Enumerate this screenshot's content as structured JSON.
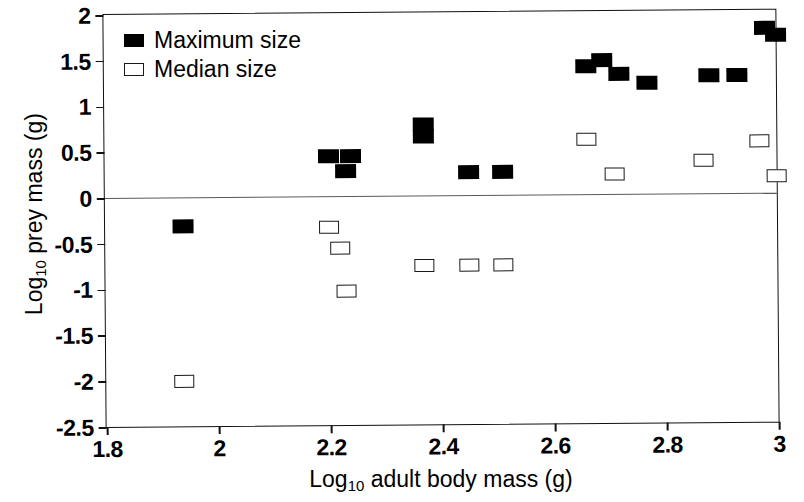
{
  "chart_data": {
    "type": "scatter",
    "title": "",
    "xlabel": "Log10 adult body mass (g)",
    "ylabel": "Log10 prey mass (g)",
    "xlabel_parts": {
      "prefix": "Log",
      "sub": "10",
      "suffix": " adult body mass (g)"
    },
    "ylabel_parts": {
      "prefix": "Log",
      "sub": "10",
      "suffix": " prey mass (g)"
    },
    "xlim": [
      1.8,
      3.0
    ],
    "ylim": [
      -2.5,
      2.0
    ],
    "xticks": [
      1.8,
      2.0,
      2.2,
      2.4,
      2.6,
      2.8,
      3.0
    ],
    "xtick_labels": [
      "1.8",
      "2",
      "2.2",
      "2.4",
      "2.6",
      "2.8",
      "3"
    ],
    "yticks": [
      2.0,
      1.5,
      1.0,
      0.5,
      0.0,
      -0.5,
      -1.0,
      -1.5,
      -2.0,
      -2.5
    ],
    "ytick_labels": [
      "2",
      "1.5",
      "1",
      "0.5",
      "0",
      "-0.5",
      "-1",
      "-1.5",
      "-2",
      "-2.5"
    ],
    "grid": false,
    "reference_lines": [
      {
        "axis": "y",
        "value": 0.0
      }
    ],
    "legend_position": "top-left",
    "marker_color": "#000000",
    "series": [
      {
        "name": "Maximum size",
        "marker": "filled-square",
        "color": "#000000",
        "points": [
          {
            "x": 1.94,
            "y": -0.32
          },
          {
            "x": 2.2,
            "y": 0.44
          },
          {
            "x": 2.24,
            "y": 0.44
          },
          {
            "x": 2.23,
            "y": 0.27
          },
          {
            "x": 2.37,
            "y": 0.78
          },
          {
            "x": 2.37,
            "y": 0.65
          },
          {
            "x": 2.45,
            "y": 0.25
          },
          {
            "x": 2.51,
            "y": 0.25
          },
          {
            "x": 2.66,
            "y": 1.4
          },
          {
            "x": 2.69,
            "y": 1.46
          },
          {
            "x": 2.72,
            "y": 1.31
          },
          {
            "x": 2.77,
            "y": 1.21
          },
          {
            "x": 2.88,
            "y": 1.29
          },
          {
            "x": 2.93,
            "y": 1.29
          },
          {
            "x": 2.98,
            "y": 1.8
          },
          {
            "x": 3.0,
            "y": 1.73
          }
        ]
      },
      {
        "name": "Median size",
        "marker": "open-square",
        "color": "#000000",
        "points": [
          {
            "x": 1.94,
            "y": -2.01
          },
          {
            "x": 2.2,
            "y": -0.34
          },
          {
            "x": 2.22,
            "y": -0.57
          },
          {
            "x": 2.23,
            "y": -1.04
          },
          {
            "x": 2.37,
            "y": -0.76
          },
          {
            "x": 2.45,
            "y": -0.76
          },
          {
            "x": 2.51,
            "y": -0.76
          },
          {
            "x": 2.66,
            "y": 0.6
          },
          {
            "x": 2.71,
            "y": 0.22
          },
          {
            "x": 2.87,
            "y": 0.36
          },
          {
            "x": 2.97,
            "y": 0.57
          },
          {
            "x": 3.0,
            "y": 0.19
          }
        ]
      }
    ]
  },
  "legend": {
    "items": [
      {
        "label": "Maximum size",
        "marker": "filled-square"
      },
      {
        "label": "Median size",
        "marker": "open-square"
      }
    ]
  }
}
